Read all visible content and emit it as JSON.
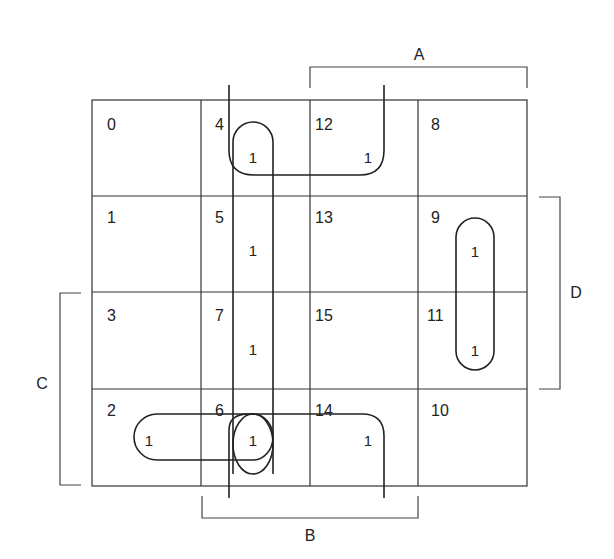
{
  "diagram": {
    "type": "karnaugh-map",
    "variables": [
      "A",
      "B",
      "C",
      "D"
    ],
    "labels": {
      "A": "A",
      "B": "B",
      "C": "C",
      "D": "D"
    },
    "cells": [
      {
        "index": "0",
        "value": ""
      },
      {
        "index": "4",
        "value": "1"
      },
      {
        "index": "12",
        "value": "1"
      },
      {
        "index": "8",
        "value": ""
      },
      {
        "index": "1",
        "value": ""
      },
      {
        "index": "5",
        "value": "1"
      },
      {
        "index": "13",
        "value": ""
      },
      {
        "index": "9",
        "value": "1"
      },
      {
        "index": "3",
        "value": ""
      },
      {
        "index": "7",
        "value": "1"
      },
      {
        "index": "15",
        "value": ""
      },
      {
        "index": "11",
        "value": "1"
      },
      {
        "index": "2",
        "value": "1"
      },
      {
        "index": "6",
        "value": "1"
      },
      {
        "index": "14",
        "value": "1"
      },
      {
        "index": "10",
        "value": ""
      }
    ],
    "groupings": [
      {
        "name": "column-B-notD-cells-4-5-7-6",
        "cells": [
          4,
          5,
          7,
          6
        ]
      },
      {
        "name": "row-B-notC-notD-cells-4-12",
        "cells": [
          4,
          12
        ]
      },
      {
        "name": "row-B-C-notD-cells-6-14",
        "cells": [
          6,
          14
        ]
      },
      {
        "name": "pair-2-6",
        "cells": [
          2,
          6
        ]
      },
      {
        "name": "single-6",
        "cells": [
          6
        ]
      },
      {
        "name": "pair-9-11",
        "cells": [
          9,
          11
        ]
      }
    ]
  }
}
